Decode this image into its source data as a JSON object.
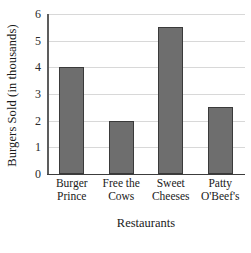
{
  "chart_data": {
    "type": "bar",
    "title": "",
    "xlabel": "Restaurants",
    "ylabel": "Burgers Sold (in thousands)",
    "categories": [
      "Burger Prince",
      "Free the Cows",
      "Sweet Cheeses",
      "Patty O'Beef's"
    ],
    "category_lines": [
      [
        "Burger",
        "Prince"
      ],
      [
        "Free the",
        "Cows"
      ],
      [
        "Sweet",
        "Cheeses"
      ],
      [
        "Patty",
        "O'Beef's"
      ]
    ],
    "values": [
      4,
      2,
      5.5,
      2.5
    ],
    "ylim": [
      0,
      6
    ],
    "ytick_labels": [
      "0",
      "1",
      "2",
      "3",
      "4",
      "5",
      "6"
    ],
    "ytick_values": [
      0,
      1,
      2,
      3,
      4,
      5,
      6
    ],
    "grid": true,
    "legend": "none",
    "colors": {
      "bar_fill": "#6e6e6e",
      "bar_edge": "#3a3a3a",
      "gridline": "#d8d8d8",
      "axis_spine": "#5d5d5d",
      "baseline": "#3c3c3c",
      "background": "#ffffff",
      "text": "#1a1a1a"
    }
  }
}
